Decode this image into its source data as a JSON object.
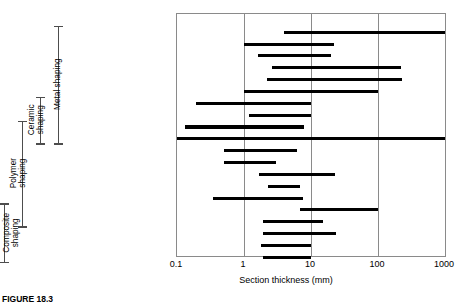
{
  "caption": "FIGURE 18.3",
  "chart_data": {
    "type": "bar",
    "subtype": "horizontal-range-bars",
    "title": "",
    "xlabel": "Section thickness (mm)",
    "ylabel": "",
    "xscale": "log",
    "xlim": [
      0.1,
      1000
    ],
    "xticks": [
      0.1,
      1,
      10,
      100,
      1000
    ],
    "xticklabels": [
      "0.1",
      "1",
      "10",
      "100",
      "1000"
    ],
    "grid": "vertical-only",
    "legend": "none",
    "bar_color": "#000000",
    "categories": [
      "Sand casting",
      "Die casting",
      "Investment casting",
      "Low pressure casting",
      "Forging",
      "Extrusion",
      "Sheet forming",
      "Powder methods",
      "Electro-machining",
      "Conventional machining",
      "Injection molding",
      "Blow molding",
      "Compression molding",
      "Rotational molding",
      "Thermal forming",
      "Polymer casting",
      "Resin-transfer molding",
      "Filament winding",
      "Layup methods",
      "Vacuum bag"
    ],
    "ranges": [
      {
        "category": "Sand casting",
        "min": 4.0,
        "max": 1000.0
      },
      {
        "category": "Die casting",
        "min": 1.0,
        "max": 22.0
      },
      {
        "category": "Investment casting",
        "min": 1.6,
        "max": 20.0
      },
      {
        "category": "Low pressure casting",
        "min": 2.6,
        "max": 220.0
      },
      {
        "category": "Forging",
        "min": 2.2,
        "max": 230.0
      },
      {
        "category": "Extrusion",
        "min": 1.0,
        "max": 100.0
      },
      {
        "category": "Sheet forming",
        "min": 0.19,
        "max": 10.0
      },
      {
        "category": "Powder methods",
        "min": 1.2,
        "max": 10.0
      },
      {
        "category": "Electro-machining",
        "min": 0.13,
        "max": 8.0
      },
      {
        "category": "Conventional machining",
        "min": 0.1,
        "max": 1000.0
      },
      {
        "category": "Injection molding",
        "min": 0.5,
        "max": 6.2
      },
      {
        "category": "Blow molding",
        "min": 0.5,
        "max": 3.0
      },
      {
        "category": "Compression molding",
        "min": 1.7,
        "max": 23.0
      },
      {
        "category": "Rotational molding",
        "min": 2.3,
        "max": 6.8
      },
      {
        "category": "Thermal forming",
        "min": 0.35,
        "max": 7.5
      },
      {
        "category": "Polymer casting",
        "min": 6.8,
        "max": 100.0
      },
      {
        "category": "Resin-transfer molding",
        "min": 1.9,
        "max": 15.0
      },
      {
        "category": "Filament winding",
        "min": 1.9,
        "max": 24.0
      },
      {
        "category": "Layup methods",
        "min": 1.8,
        "max": 10.0
      },
      {
        "category": "Vacuum bag",
        "min": 1.9,
        "max": 10.0
      }
    ],
    "groups": [
      {
        "label": "Metal shaping",
        "first": "Sand casting",
        "last": "Conventional machining"
      },
      {
        "label": "Ceramic shaping",
        "first": "Sheet forming",
        "last": "Conventional machining"
      },
      {
        "label": "Polymer shaping",
        "first": "Electro-machining",
        "last": "Resin-transfer molding"
      },
      {
        "label": "Composite shaping",
        "first": "Polymer casting",
        "last": "Vacuum bag"
      }
    ]
  }
}
